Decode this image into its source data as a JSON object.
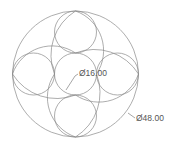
{
  "drawing": {
    "units_scale_px_per_unit": 2.62,
    "center": {
      "x": 75.5,
      "y": 74
    },
    "outer_circle": {
      "diameter_label": "Ø48.00",
      "diameter": 48
    },
    "inner_circle": {
      "diameter_label": "Ø16.00",
      "diameter": 16
    },
    "small_circles": {
      "count": 4,
      "diameter": 16,
      "positions": [
        "top",
        "right",
        "bottom",
        "left"
      ]
    },
    "swirl_arcs": {
      "count": 4
    }
  },
  "labels": {
    "inner_dim": "Ø16.00",
    "outer_dim": "Ø48.00"
  },
  "colors": {
    "line": "#8a8a8a",
    "text": "#555555",
    "background": "#ffffff"
  }
}
